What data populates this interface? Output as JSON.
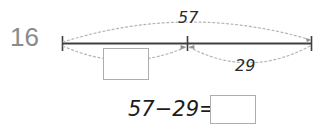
{
  "worksheet": {
    "item_number": "16",
    "number_line": {
      "total_label": "57",
      "known_part_label": "29",
      "unknown_part_placeholder": "",
      "tick_count": 3
    },
    "equation": {
      "text": "57−29=",
      "minuend": "57",
      "operator": "−",
      "subtrahend": "29",
      "equals": "=",
      "answer_placeholder": ""
    },
    "colors": {
      "item_number": "#8a8a8a",
      "line": "#3f3f3f",
      "arc": "#b4b4b4",
      "box_border": "#adadad",
      "text": "#1c1c1c",
      "background": "#ffffff"
    }
  }
}
